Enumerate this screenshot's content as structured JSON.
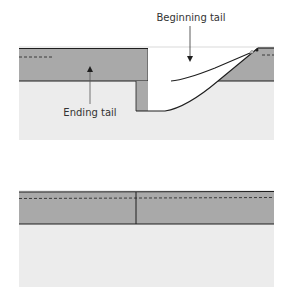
{
  "colors": {
    "background": "#ffffff",
    "ground": "#ececec",
    "water": "#a9a9a9",
    "line": "#1e1e1e"
  },
  "upper_diagram": {
    "labels": {
      "beginning_tail": "Beginning tail",
      "ending_tail": "Ending tail"
    }
  },
  "lower_diagram": {}
}
